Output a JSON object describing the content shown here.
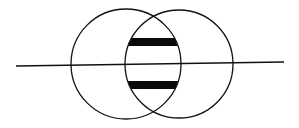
{
  "diagram": {
    "type": "overlapping-circles-with-line",
    "colors": {
      "stroke": "#111111",
      "fill_bars": "#0a0a0a",
      "background": "#ffffff"
    },
    "circles": [
      {
        "id": "left-circle",
        "cx": 126,
        "cy": 64,
        "r": 55
      },
      {
        "id": "right-circle",
        "cx": 179,
        "cy": 64,
        "r": 54
      }
    ],
    "line": {
      "x1": 16,
      "y1": 66,
      "x2": 284,
      "y2": 62
    },
    "bars": [
      {
        "id": "top-bar",
        "y": 38,
        "height": 8
      },
      {
        "id": "bottom-bar",
        "y": 81,
        "height": 8
      }
    ]
  }
}
